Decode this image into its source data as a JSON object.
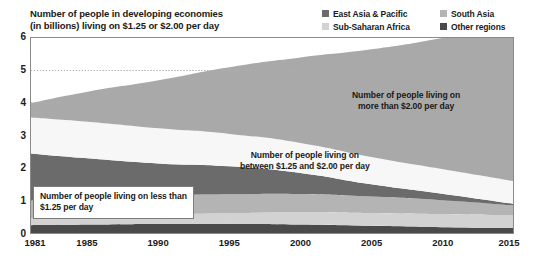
{
  "title": {
    "line1": "Number of people in developing economies",
    "line2": "(in billions) living on $1.25 or $2.00 per day"
  },
  "legend": {
    "items": [
      {
        "label": "East Asia & Pacific",
        "color": "#6b6b6b"
      },
      {
        "label": "Sub-Saharan Africa",
        "color": "#d2d2d2"
      },
      {
        "label": "South Asia",
        "color": "#b4b4b4"
      },
      {
        "label": "Other regions",
        "color": "#4a4a4a"
      }
    ]
  },
  "axes": {
    "y_ticks": [
      "6",
      "5",
      "4",
      "3",
      "2",
      "1",
      "0"
    ],
    "x_ticks": [
      "1981",
      "1985",
      "1990",
      "1995",
      "2000",
      "2005",
      "2010",
      "2015"
    ]
  },
  "annotations": {
    "above_two": {
      "line1": "Number of people living on",
      "line2": "more than $2.00 per day"
    },
    "between": {
      "line1": "Number of people living on",
      "line2": "between $1.25 and $2.00 per day"
    },
    "below": {
      "line1": "Number of people living on less than",
      "line2": "$1.25 per day"
    }
  },
  "colors": {
    "above_two_dollar": "#a9a9a9",
    "between_band": "#f7f7f7",
    "east_asia_pacific": "#6b6b6b",
    "south_asia": "#b4b4b4",
    "sub_saharan_africa": "#d2d2d2",
    "other_regions": "#4a4a4a",
    "axis_line": "#7d7d7d",
    "gridline": "#b0b0b0",
    "text": "#1a1a1a"
  },
  "chart_data": {
    "type": "area",
    "title": "Number of people in developing economies (in billions) living on $1.25 or $2.00 per day",
    "subtitle": "",
    "xlabel": "",
    "ylabel": "Number of people (billions)",
    "stacked": true,
    "grid": true,
    "legend_position": "top-right",
    "xlim": [
      1981,
      2015
    ],
    "ylim": [
      0,
      6
    ],
    "yticks": [
      0,
      1,
      2,
      3,
      4,
      5,
      6
    ],
    "xticks": [
      1981,
      1985,
      1990,
      1995,
      2000,
      2005,
      2010,
      2015
    ],
    "x": [
      1981,
      1985,
      1990,
      1995,
      2000,
      2005,
      2010,
      2015
    ],
    "series": [
      {
        "name": "Other regions",
        "note": "living on less than $1.25 per day",
        "color": "#4a4a4a",
        "values": [
          0.24,
          0.26,
          0.28,
          0.28,
          0.26,
          0.22,
          0.18,
          0.15
        ]
      },
      {
        "name": "Sub-Saharan Africa",
        "note": "living on less than $1.25 per day",
        "color": "#d2d2d2",
        "values": [
          0.21,
          0.24,
          0.29,
          0.33,
          0.38,
          0.39,
          0.4,
          0.4
        ]
      },
      {
        "name": "South Asia",
        "note": "living on less than $1.25 per day",
        "color": "#b4b4b4",
        "values": [
          0.55,
          0.56,
          0.58,
          0.58,
          0.56,
          0.51,
          0.43,
          0.3
        ]
      },
      {
        "name": "East Asia & Pacific",
        "note": "living on less than $1.25 per day",
        "color": "#6b6b6b",
        "values": [
          1.45,
          1.24,
          0.99,
          0.86,
          0.65,
          0.38,
          0.2,
          0.05
        ]
      },
      {
        "name": "Number of people living on between $1.25 and $2.00 per day",
        "color": "#f7f7f7",
        "values": [
          1.1,
          1.12,
          1.08,
          1.0,
          0.92,
          0.84,
          0.76,
          0.7
        ]
      },
      {
        "name": "Number of people living on more than $2.00 per day",
        "color": "#a9a9a9",
        "values": [
          0.45,
          0.93,
          1.48,
          2.05,
          2.63,
          3.31,
          4.03,
          4.85
        ]
      }
    ],
    "stack_tops": {
      "below_1_25": [
        2.45,
        2.3,
        2.14,
        2.05,
        1.85,
        1.5,
        1.21,
        0.9
      ],
      "below_2_00": [
        3.55,
        3.42,
        3.22,
        3.05,
        2.77,
        2.34,
        1.97,
        1.6
      ],
      "total": [
        4.0,
        4.35,
        4.7,
        5.1,
        5.4,
        5.65,
        6.0,
        6.45
      ]
    },
    "annotations": [
      {
        "text": "Number of people living on more than $2.00 per day",
        "x": 2007,
        "y": 4.1
      },
      {
        "text": "Number of people living on between $1.25 and $2.00 per day",
        "x": 1999,
        "y": 2.3
      },
      {
        "text": "Number of people living on less than $1.25 per day",
        "x": 1988,
        "y": 1.1
      }
    ]
  }
}
